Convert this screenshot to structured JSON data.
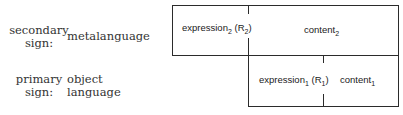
{
  "rows": [
    {
      "label_line1": "secondary",
      "label_line2": "sign:",
      "language_line1": "metalanguage",
      "language_line2": ""
    },
    {
      "label_line1": "primary",
      "label_line2": "sign:",
      "language_line1": "object",
      "language_line2": "language"
    }
  ],
  "secondary_box": {
    "expression_text": "expression",
    "expression_sub": "2",
    "relation_open": " (R",
    "relation_sub": "2",
    "relation_close": ")",
    "content_text": "content",
    "content_sub": "2"
  },
  "primary_box": {
    "expression_text": "expression",
    "expression_sub": "1",
    "relation_open": " (R",
    "relation_sub": "1",
    "relation_close": ")",
    "content_text": "content",
    "content_sub": "1"
  },
  "colors": {
    "line": "#2b2b2b",
    "text": "#1a1a1a",
    "background": "#ffffff"
  }
}
